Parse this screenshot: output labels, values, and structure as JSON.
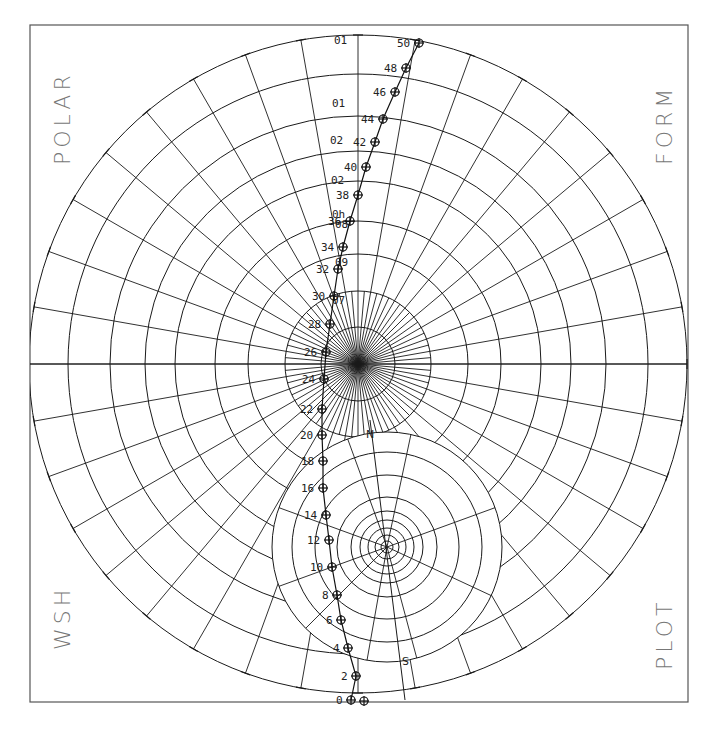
{
  "corner_labels": {
    "top_left": "POLAR",
    "top_right": "FORM",
    "bottom_left": "WSH",
    "bottom_right": "PLOT"
  },
  "axis_marks": {
    "north": "N",
    "south": "S"
  },
  "colors": {
    "ink": "#1a1a1a",
    "frame": "#555555",
    "label": "#777777",
    "background": "#ffffff"
  },
  "chart_data": {
    "type": "scatter",
    "subtitle": "",
    "xlabel": "",
    "ylabel": "",
    "coordinate_system": "polar",
    "grid": true,
    "legend": null,
    "frame": {
      "x": 30,
      "y": 25,
      "width": 658,
      "height": 677
    },
    "main_grid": {
      "center": [
        358,
        364
      ],
      "outer_radius": 329,
      "ring_radii": [
        329,
        290,
        248,
        213,
        183,
        143,
        110,
        73,
        37
      ],
      "ray_spacing_deg": 10,
      "ticks_on_outer_ring": true
    },
    "ring_labels": [
      {
        "text": "01",
        "x": 344,
        "y": 40
      },
      {
        "text": "01",
        "x": 342,
        "y": 103
      },
      {
        "text": "02",
        "x": 340,
        "y": 140
      },
      {
        "text": "02",
        "x": 341,
        "y": 180
      },
      {
        "text": "0h",
        "x": 342,
        "y": 214
      },
      {
        "text": "08",
        "x": 345,
        "y": 224
      },
      {
        "text": "09",
        "x": 345,
        "y": 262
      },
      {
        "text": "07",
        "x": 342,
        "y": 300
      }
    ],
    "secondary_grid": {
      "center": [
        387,
        547
      ],
      "ring_radii": [
        115,
        95,
        72,
        50,
        36,
        27,
        19,
        12,
        6
      ]
    },
    "series": [
      {
        "name": "track",
        "points": [
          {
            "label": "0",
            "x": 351,
            "y": 700
          },
          {
            "label": "2",
            "x": 356,
            "y": 676
          },
          {
            "label": "4",
            "x": 348,
            "y": 648
          },
          {
            "label": "6",
            "x": 341,
            "y": 620
          },
          {
            "label": "8",
            "x": 337,
            "y": 595
          },
          {
            "label": "10",
            "x": 332,
            "y": 567
          },
          {
            "label": "12",
            "x": 329,
            "y": 540
          },
          {
            "label": "14",
            "x": 326,
            "y": 515
          },
          {
            "label": "16",
            "x": 323,
            "y": 488
          },
          {
            "label": "18",
            "x": 323,
            "y": 461
          },
          {
            "label": "20",
            "x": 322,
            "y": 435
          },
          {
            "label": "22",
            "x": 322,
            "y": 409
          },
          {
            "label": "24",
            "x": 324,
            "y": 379
          },
          {
            "label": "26",
            "x": 326,
            "y": 352
          },
          {
            "label": "28",
            "x": 330,
            "y": 324
          },
          {
            "label": "30",
            "x": 334,
            "y": 296
          },
          {
            "label": "32",
            "x": 338,
            "y": 269
          },
          {
            "label": "34",
            "x": 343,
            "y": 247
          },
          {
            "label": "36",
            "x": 350,
            "y": 221
          },
          {
            "label": "38",
            "x": 358,
            "y": 195
          },
          {
            "label": "40",
            "x": 366,
            "y": 167
          },
          {
            "label": "42",
            "x": 375,
            "y": 142
          },
          {
            "label": "44",
            "x": 383,
            "y": 119
          },
          {
            "label": "46",
            "x": 395,
            "y": 92
          },
          {
            "label": "48",
            "x": 406,
            "y": 68
          },
          {
            "label": "50",
            "x": 419,
            "y": 43
          }
        ]
      }
    ],
    "extra_point": {
      "x": 364,
      "y": 701
    }
  }
}
